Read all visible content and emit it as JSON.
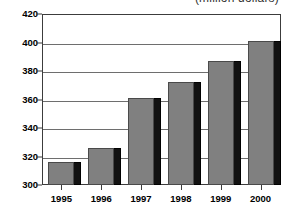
{
  "chart_data": {
    "type": "bar",
    "title": "(million dollars)",
    "xlabel": "",
    "ylabel": "",
    "categories": [
      "1995",
      "1996",
      "1997",
      "1998",
      "1999",
      "2000"
    ],
    "values": [
      316,
      326,
      361,
      372,
      387,
      401
    ],
    "ylim": [
      300,
      420
    ],
    "ytick_values": [
      300,
      320,
      340,
      360,
      380,
      400,
      420
    ],
    "ytick_labels": [
      "300",
      "320",
      "340",
      "360",
      "380",
      "400",
      "420"
    ],
    "grid": true,
    "legend": "none",
    "style": "3d-shaded-bars",
    "colors": {
      "bar_face": "#808080",
      "bar_shadow": "#121212",
      "gridline": "#6e6e6e",
      "frame": "#3c3c3c",
      "background": "#ffffff",
      "text": "#000000"
    }
  }
}
